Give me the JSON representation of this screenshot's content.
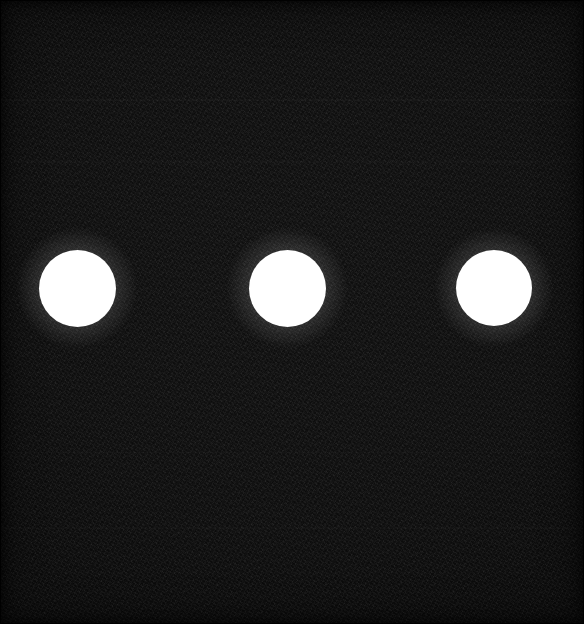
{
  "scene": {
    "title": "Three white circular markers on dark background",
    "width": 584,
    "height": 624,
    "background_color": "#0d0d0d",
    "background_description": "near-black noisy field with faint horizontal scanline banding and darker vignetted edges",
    "marker_color": "#ffffff",
    "marker_count": 3
  },
  "chart_data": {
    "type": "scatter",
    "xlabel": "",
    "ylabel": "",
    "xlim": [
      0,
      584
    ],
    "ylim": [
      0,
      624
    ],
    "grid": false,
    "legend": null,
    "background_color": "#0d0d0d",
    "series": [
      {
        "name": "markers",
        "color": "#ffffff",
        "marker": "circle",
        "points": [
          {
            "label": "marker-1",
            "x": 77,
            "y": 288,
            "diameter": 77,
            "radius": 38.5
          },
          {
            "label": "marker-2",
            "x": 287,
            "y": 288,
            "diameter": 77,
            "radius": 38.5
          },
          {
            "label": "marker-3",
            "x": 494,
            "y": 288,
            "diameter": 76,
            "radius": 38.0
          }
        ]
      }
    ],
    "annotations": []
  },
  "markers": [
    {
      "name": "marker-1",
      "cx": 77,
      "cy": 288,
      "d": 77
    },
    {
      "name": "marker-2",
      "cx": 287,
      "cy": 288,
      "d": 77
    },
    {
      "name": "marker-3",
      "cx": 494,
      "cy": 288,
      "d": 76
    }
  ]
}
